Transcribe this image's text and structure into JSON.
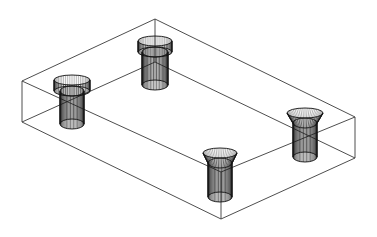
{
  "drawing": {
    "title": "Isometric wireframe: rectangular plate with four holes",
    "view": "isometric",
    "render_mode": "wireframe",
    "colors": {
      "background": "#ffffff",
      "line": "#3a3a3a",
      "hatch": "#1a1a1a"
    },
    "box": {
      "vertices": {
        "top_back": [
          155,
          19
        ],
        "top_left": [
          22,
          81
        ],
        "top_right": [
          355,
          117
        ],
        "top_front": [
          221,
          172
        ],
        "bottom_back": [
          155,
          62
        ],
        "bottom_left": [
          22,
          122
        ],
        "bottom_right": [
          355,
          158
        ],
        "bottom_front": [
          221,
          219
        ]
      },
      "edges": [
        [
          "top_back",
          "top_left"
        ],
        [
          "top_back",
          "top_right"
        ],
        [
          "top_left",
          "top_front"
        ],
        [
          "top_right",
          "top_front"
        ],
        [
          "bottom_back",
          "bottom_left"
        ],
        [
          "bottom_back",
          "bottom_right"
        ],
        [
          "bottom_left",
          "bottom_front"
        ],
        [
          "bottom_right",
          "bottom_front"
        ],
        [
          "top_back",
          "bottom_back"
        ],
        [
          "top_left",
          "bottom_left"
        ],
        [
          "top_right",
          "bottom_right"
        ],
        [
          "top_front",
          "bottom_front"
        ]
      ]
    },
    "holes": [
      {
        "id": "hole-back",
        "type": "counterbore",
        "cx": 155,
        "top_y": 41,
        "head_rx": 17,
        "head_bottom_y": 52,
        "shaft_rx": 13,
        "shaft_bottom_y": 85,
        "ry": 5,
        "lines": 26
      },
      {
        "id": "hole-left",
        "type": "counterbore",
        "cx": 72,
        "top_y": 80,
        "head_rx": 18,
        "head_bottom_y": 91,
        "shaft_rx": 12,
        "shaft_bottom_y": 124,
        "ry": 5,
        "lines": 26
      },
      {
        "id": "hole-front",
        "type": "countersink",
        "cx": 220,
        "top_y": 153,
        "head_rx": 17,
        "head_bottom_y": 163,
        "shaft_rx": 12,
        "shaft_bottom_y": 197,
        "ry": 5,
        "lines": 26
      },
      {
        "id": "hole-right",
        "type": "countersink",
        "cx": 305,
        "top_y": 113,
        "head_rx": 18,
        "head_bottom_y": 123,
        "shaft_rx": 12,
        "shaft_bottom_y": 157,
        "ry": 5,
        "lines": 26
      }
    ]
  }
}
